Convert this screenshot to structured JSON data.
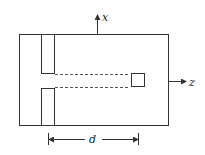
{
  "diagram": {
    "title": "",
    "colors": {
      "stroke": "#333333",
      "background": "#ffffff"
    },
    "axes": {
      "x_label": "x",
      "z_label": "z"
    },
    "dimension": {
      "label": "d"
    },
    "elements": [
      {
        "name": "outer-box",
        "shape": "rectangle"
      },
      {
        "name": "upper-slit-bar",
        "shape": "rectangle"
      },
      {
        "name": "lower-slit-bar",
        "shape": "rectangle"
      },
      {
        "name": "slit-aperture",
        "shape": "gap"
      },
      {
        "name": "upper-dashed-line",
        "shape": "dashed-line"
      },
      {
        "name": "lower-dashed-line",
        "shape": "dashed-line"
      },
      {
        "name": "detector-square",
        "shape": "square"
      }
    ]
  }
}
